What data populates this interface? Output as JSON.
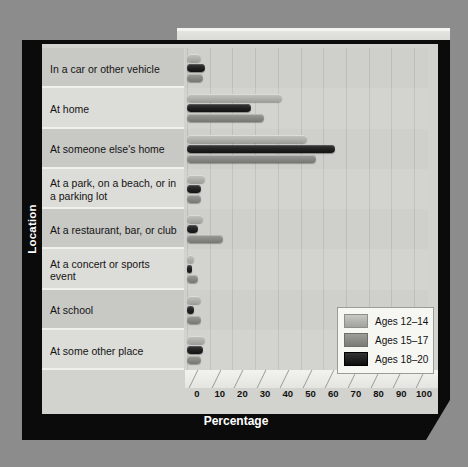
{
  "chart_data": {
    "type": "bar",
    "orientation": "horizontal",
    "title": "",
    "xlabel": "Percentage",
    "ylabel": "Location",
    "xlim": [
      0,
      100
    ],
    "xticks": [
      0,
      10,
      20,
      30,
      40,
      50,
      60,
      70,
      80,
      90,
      100
    ],
    "xticklabels": [
      "0",
      "10",
      "20",
      "30",
      "40",
      "50",
      "60",
      "70",
      "80",
      "90",
      "100"
    ],
    "grid": true,
    "legend_position": "lower-right",
    "categories": [
      "In a car or other vehicle",
      "At home",
      "At someone else's home",
      "At a park, on a beach, or in a parking lot",
      "At a restaurant, bar, or club",
      "At a concert or sports event",
      "At school",
      "At some other place"
    ],
    "series": [
      {
        "name": "Ages 12–14",
        "color": "#b4b4b0",
        "values": [
          6,
          42,
          53,
          8,
          7,
          3,
          6,
          8
        ]
      },
      {
        "name": "Ages 15–17",
        "color": "#8a8a86",
        "values": [
          7,
          34,
          57,
          6,
          16,
          5,
          6,
          6
        ]
      },
      {
        "name": "Ages 18–20",
        "color": "#1a1a1a",
        "values": [
          8,
          28,
          65,
          6,
          5,
          2,
          3,
          7
        ]
      }
    ]
  },
  "legend": {
    "entries": [
      {
        "label": "Ages 12–14",
        "swatch": "light-gray-swatch"
      },
      {
        "label": "Ages 15–17",
        "swatch": "medium-gray-swatch"
      },
      {
        "label": "Ages 18–20",
        "swatch": "black-swatch"
      }
    ]
  },
  "axis": {
    "x_title": "Percentage",
    "y_title": "Location"
  }
}
